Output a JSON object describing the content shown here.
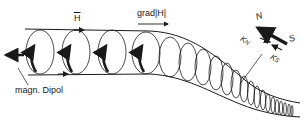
{
  "diagram": {
    "labels": {
      "magnetic_dipole": "magn. Dipol",
      "field": "H",
      "gradient": "grad|H|",
      "north": "N",
      "south": "S",
      "force_north": "K",
      "force_north_sub": "N",
      "force_south": "K",
      "force_south_sub": "S"
    },
    "elements": [
      "field-line-top",
      "field-line-bottom",
      "gyration-loops",
      "dipole-arrows",
      "dipole-direction-arrow",
      "gradient-arrow",
      "compass-needle-NS",
      "force-arrows-KN-KS"
    ],
    "colors": {
      "ink": "#1a1a1a",
      "background": "#ffffff"
    }
  }
}
